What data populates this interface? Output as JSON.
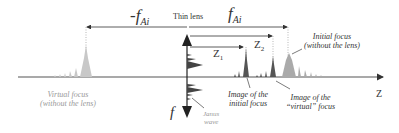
{
  "diagram": {
    "labels": {
      "neg_focal": {
        "prefix": "-f",
        "sub": "Ai"
      },
      "pos_focal": {
        "prefix": "f",
        "sub": "Ai"
      },
      "thin_lens": "Thin lens",
      "z1": {
        "prefix": "Z",
        "sub": "1"
      },
      "z2": {
        "prefix": "Z",
        "sub": "2"
      },
      "axis": "Z",
      "f_axis": "f",
      "initial_focus_l1": "Initial focus",
      "initial_focus_l2": "(without the lens)",
      "virtual_focus_l1": "Virtual focus",
      "virtual_focus_l2": "(without the lens)",
      "image_initial_l1": "Image of the",
      "image_initial_l2": "initial focus",
      "image_virtual_l1": "Image of the",
      "image_virtual_l2": "“virtual” focus",
      "janus_l1": "Janus",
      "janus_l2": "wave"
    },
    "colors": {
      "line": "#333333",
      "peak_dark": "#555555",
      "peak_light": "#bbbbbb",
      "label_gray": "#999999"
    }
  }
}
